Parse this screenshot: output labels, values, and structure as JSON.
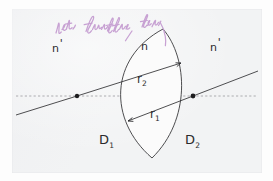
{
  "figure": {
    "kind": "optics-lens-diagram",
    "paper_color": "#f2f3f4",
    "ink_color": "#2a2a2c",
    "annotation_color": "#c49ad0"
  },
  "labels": {
    "n_left": "n",
    "n_left_prime": "'",
    "n_medium": "n",
    "n_right": "n",
    "n_right_prime": "'",
    "r2": "r",
    "r2_sub": "2",
    "r1": "r",
    "r1_sub": "1",
    "d1": "D",
    "d1_sub": "1",
    "d2": "D",
    "d2_sub": "2"
  },
  "annotation": {
    "handwriting": "Licht durchflutet Fluss",
    "legible": false,
    "color": "#c49ad0",
    "note": "pink cursive handwriting across the top, largely illegible"
  },
  "geometry": {
    "optical_axis_y": 96,
    "axis_style": "dashed",
    "center_left_x": 77,
    "center_right_x": 193,
    "lens_vertex_top_x": 163,
    "lens_vertex_top_y": 29,
    "lens_vertex_bottom_x": 152,
    "lens_vertex_bottom_y": 158,
    "r2_from": [
      18,
      92
    ],
    "r2_to": [
      181,
      64
    ],
    "r1_from": [
      129,
      120
    ],
    "r1_to": [
      273,
      95
    ]
  }
}
